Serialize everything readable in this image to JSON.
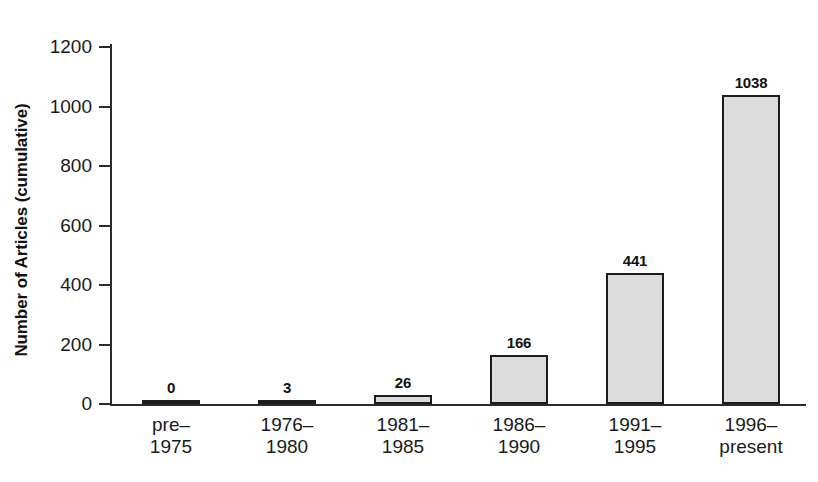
{
  "chart_data": {
    "type": "bar",
    "title": "",
    "xlabel": "",
    "ylabel": "Number of Articles (cumulative)",
    "categories": [
      "pre–\n1975",
      "1976–\n1980",
      "1981–\n1985",
      "1986–\n1990",
      "1991–\n1995",
      "1996–\npresent"
    ],
    "category_lines": [
      [
        "pre–",
        "1975"
      ],
      [
        "1976–",
        "1980"
      ],
      [
        "1981–",
        "1985"
      ],
      [
        "1986–",
        "1990"
      ],
      [
        "1991–",
        "1995"
      ],
      [
        "1996–",
        "present"
      ]
    ],
    "values": [
      0,
      3,
      26,
      166,
      441,
      1038
    ],
    "value_labels": [
      "0",
      "3",
      "26",
      "166",
      "441",
      "1038"
    ],
    "ylim": [
      0,
      1200
    ],
    "yticks": [
      0,
      200,
      400,
      600,
      800,
      1000,
      1200
    ],
    "ytick_labels": [
      "0",
      "200",
      "400",
      "600",
      "800",
      "1000",
      "1200"
    ],
    "grid": false,
    "legend": null,
    "bar_fill_color": "#dcdcdc",
    "bar_border_color": "#1c1c1c",
    "axis_color": "#2b2b2b",
    "background_color": "#ffffff"
  }
}
